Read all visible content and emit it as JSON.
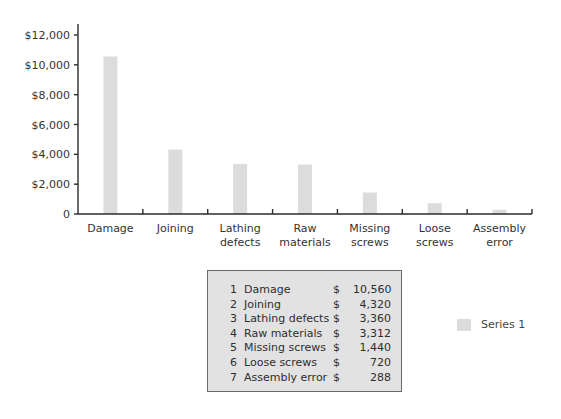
{
  "chart_data": {
    "type": "bar",
    "title": "",
    "xlabel": "",
    "ylabel": "",
    "categories": [
      "Damage",
      "Joining",
      "Lathing defects",
      "Raw materials",
      "Missing screws",
      "Loose screws",
      "Assembly error"
    ],
    "category_lines": [
      [
        "Damage"
      ],
      [
        "Joining"
      ],
      [
        "Lathing",
        "defects"
      ],
      [
        "Raw",
        "materials"
      ],
      [
        "Missing",
        "screws"
      ],
      [
        "Loose",
        "screws"
      ],
      [
        "Assembly",
        "error"
      ]
    ],
    "series": [
      {
        "name": "Series 1",
        "values": [
          10560,
          4320,
          3360,
          3312,
          1440,
          720,
          288
        ],
        "color": "#dcdcdc"
      }
    ],
    "ylim": [
      0,
      12000
    ],
    "y_ticks": [
      0,
      2000,
      4000,
      6000,
      8000,
      10000,
      12000
    ],
    "y_tick_labels": [
      "0",
      "$2,000",
      "$4,000",
      "$6,000",
      "$8,000",
      "$10,000",
      "$12,000"
    ],
    "grid": false,
    "legend_position": "right"
  },
  "table": {
    "rows": [
      {
        "index": "1",
        "label": "Damage",
        "currency": "$",
        "value": "10,560"
      },
      {
        "index": "2",
        "label": "Joining",
        "currency": "$",
        "value": "4,320"
      },
      {
        "index": "3",
        "label": "Lathing defects",
        "currency": "$",
        "value": "3,360"
      },
      {
        "index": "4",
        "label": "Raw materials",
        "currency": "$",
        "value": "3,312"
      },
      {
        "index": "5",
        "label": "Missing screws",
        "currency": "$",
        "value": "1,440"
      },
      {
        "index": "6",
        "label": "Loose screws",
        "currency": "$",
        "value": "720"
      },
      {
        "index": "7",
        "label": "Assembly error",
        "currency": "$",
        "value": "288"
      }
    ]
  },
  "legend": {
    "label": "Series 1",
    "color": "#dcdcdc"
  }
}
